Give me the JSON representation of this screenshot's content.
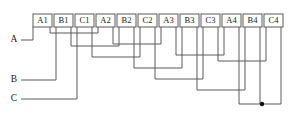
{
  "diagram": {
    "type": "electrical-winding-schematic",
    "colors": {
      "line": "#5a5a5a",
      "text": "#1a1a1a",
      "background": "#ffffff",
      "junction": "#111111"
    },
    "canvas": {
      "width": 289,
      "height": 120
    },
    "coil_groups": [
      {
        "id": "A1",
        "label": "A1",
        "phase": "A",
        "index": 1,
        "x": 33,
        "y": 14,
        "w": 19,
        "h": 13,
        "stub_bottom": 33
      },
      {
        "id": "B1",
        "label": "B1",
        "phase": "B",
        "index": 1,
        "x": 54,
        "y": 14,
        "w": 19,
        "h": 13,
        "stub_bottom": 46
      },
      {
        "id": "C1",
        "label": "C1",
        "phase": "C",
        "index": 1,
        "x": 75,
        "y": 14,
        "w": 19,
        "h": 13,
        "stub_bottom": 57
      },
      {
        "id": "A2",
        "label": "A2",
        "phase": "A",
        "index": 2,
        "x": 96,
        "y": 14,
        "w": 19,
        "h": 13,
        "stub_bottom": 44
      },
      {
        "id": "B2",
        "label": "B2",
        "phase": "B",
        "index": 2,
        "x": 117,
        "y": 14,
        "w": 19,
        "h": 13,
        "stub_bottom": 57
      },
      {
        "id": "C2",
        "label": "C2",
        "phase": "C",
        "index": 2,
        "x": 138,
        "y": 14,
        "w": 19,
        "h": 13,
        "stub_bottom": 68
      },
      {
        "id": "A3",
        "label": "A3",
        "phase": "A",
        "index": 3,
        "x": 159,
        "y": 14,
        "w": 19,
        "h": 13,
        "stub_bottom": 55
      },
      {
        "id": "B3",
        "label": "B3",
        "phase": "B",
        "index": 3,
        "x": 180,
        "y": 14,
        "w": 19,
        "h": 13,
        "stub_bottom": 44
      },
      {
        "id": "C3",
        "label": "C3",
        "phase": "C",
        "index": 3,
        "x": 201,
        "y": 14,
        "w": 19,
        "h": 13,
        "stub_bottom": 57
      },
      {
        "id": "A4",
        "label": "A4",
        "phase": "A",
        "index": 4,
        "x": 222,
        "y": 14,
        "w": 19,
        "h": 13,
        "stub_bottom": 75
      },
      {
        "id": "B4",
        "label": "B4",
        "phase": "B",
        "index": 4,
        "x": 243,
        "y": 14,
        "w": 19,
        "h": 13,
        "stub_bottom": 104
      },
      {
        "id": "C4",
        "label": "C4",
        "phase": "C",
        "index": 4,
        "x": 264,
        "y": 14,
        "w": 19,
        "h": 13,
        "stub_bottom": 90
      }
    ],
    "phase_terminals": [
      {
        "id": "A",
        "label": "A",
        "x": 14,
        "y": 40,
        "lead_to_x": 37,
        "lead_y": 40
      },
      {
        "id": "B",
        "label": "B",
        "x": 14,
        "y": 80,
        "lead_to_x": 69,
        "lead_y": 80
      },
      {
        "id": "C",
        "label": "C",
        "x": 14,
        "y": 99,
        "lead_to_x": 79,
        "lead_y": 99
      }
    ],
    "junctions": [
      {
        "id": "star-point",
        "label": "star-point",
        "x": 262,
        "y": 104,
        "r": 2.2
      }
    ],
    "connections": [
      {
        "id": "A1-A2",
        "from": "A1",
        "to": "A2",
        "level": 33
      },
      {
        "id": "B1-B2",
        "from": "B1",
        "to": "B2",
        "level": 46
      },
      {
        "id": "C1-C2",
        "from": "C1",
        "to": "C2",
        "level": 57
      },
      {
        "id": "A2-A3",
        "from": "A2",
        "to": "A3",
        "level": 44
      },
      {
        "id": "B2-B3",
        "from": "B2",
        "to": "B3",
        "level": 57
      },
      {
        "id": "C2-C3",
        "from": "C2",
        "to": "C3",
        "level": 68
      },
      {
        "id": "A3-A4",
        "from": "A3",
        "to": "A4",
        "level": 55
      },
      {
        "id": "B3-B4",
        "from": "B3",
        "to": "B4",
        "level": 44
      },
      {
        "id": "C3-C4",
        "from": "C3",
        "to": "C4",
        "level": 57
      },
      {
        "id": "A4-star",
        "from": "A4",
        "to": "star-point",
        "level": 104
      },
      {
        "id": "C4-star",
        "from": "C4",
        "to": "star-point",
        "level": 90
      },
      {
        "id": "B4-star",
        "from": "B4",
        "to": "star-point",
        "level": 104
      }
    ]
  }
}
